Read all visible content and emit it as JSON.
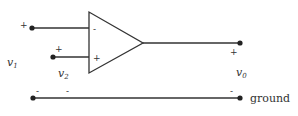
{
  "diagram": {
    "colors": {
      "line": "#333333",
      "background": "#ffffff"
    },
    "opamp": {
      "inverting_sign": "-",
      "noninverting_sign": "+"
    },
    "inputs": [
      {
        "name": "v",
        "subscript": "1",
        "plus": "+",
        "minus": "-"
      },
      {
        "name": "v",
        "subscript": "2",
        "plus": "+",
        "minus": "-"
      }
    ],
    "output": {
      "name": "v",
      "subscript": "0",
      "plus": "+",
      "minus": "-"
    },
    "ground_label": "ground"
  }
}
